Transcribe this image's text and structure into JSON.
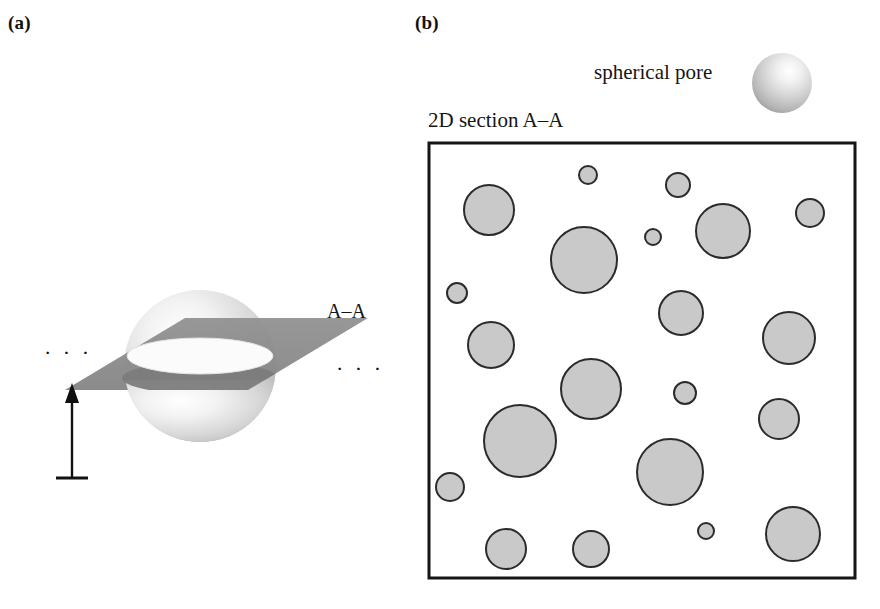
{
  "figure": {
    "background_color": "#ffffff",
    "width": 880,
    "height": 609
  },
  "panels": {
    "a": {
      "label": "(a)",
      "caption_aa": "A–A",
      "ellipsis_left": "· · ·",
      "ellipsis_right": "· · ·",
      "sphere": {
        "cx": 200,
        "cy": 366,
        "r": 76,
        "highlight_color": "#fdfdfd",
        "mid_color": "#d2d2d2",
        "edge_color": "#9a9a9a"
      },
      "cutting_plane": {
        "fill_color": "#8d8d8d",
        "band_fill_color": "#7e7e7e",
        "points": "65,390 185,318 368,318 248,390",
        "description": "horizontal sectioning plane A-A through sphere equator"
      },
      "depth_arrow": {
        "x": 72,
        "top_y": 386,
        "bottom_y": 478,
        "baseline_half_width": 16,
        "color": "#111111",
        "description": "vertical arrow indicating section depth"
      }
    },
    "b": {
      "label": "(b)",
      "legend_label": "spherical pore",
      "section_caption": "2D section A–A",
      "legend_sphere": {
        "cx": 782,
        "cy": 83,
        "r": 30,
        "highlight_color": "#fefefe",
        "mid_color": "#cfcfcf",
        "edge_color": "#8f8f8f"
      },
      "section_box": {
        "x": 429,
        "y": 143,
        "width": 426,
        "height": 435,
        "stroke_color": "#151515",
        "stroke_width": 3,
        "fill_color": "#ffffff"
      },
      "pore_style": {
        "fill_color": "#c9c9c9",
        "stroke_color": "#2b2b2b",
        "stroke_width": 2
      },
      "pores": [
        {
          "id": 1,
          "cx": 588,
          "cy": 175,
          "r": 9
        },
        {
          "id": 2,
          "cx": 678,
          "cy": 185,
          "r": 12
        },
        {
          "id": 3,
          "cx": 489,
          "cy": 210,
          "r": 25
        },
        {
          "id": 4,
          "cx": 810,
          "cy": 213,
          "r": 14
        },
        {
          "id": 5,
          "cx": 723,
          "cy": 231,
          "r": 27
        },
        {
          "id": 6,
          "cx": 584,
          "cy": 260,
          "r": 33
        },
        {
          "id": 7,
          "cx": 653,
          "cy": 237,
          "r": 8
        },
        {
          "id": 8,
          "cx": 457,
          "cy": 293,
          "r": 10
        },
        {
          "id": 9,
          "cx": 491,
          "cy": 345,
          "r": 23
        },
        {
          "id": 10,
          "cx": 681,
          "cy": 313,
          "r": 22
        },
        {
          "id": 11,
          "cx": 789,
          "cy": 338,
          "r": 26
        },
        {
          "id": 12,
          "cx": 591,
          "cy": 389,
          "r": 30
        },
        {
          "id": 13,
          "cx": 685,
          "cy": 393,
          "r": 11
        },
        {
          "id": 14,
          "cx": 520,
          "cy": 441,
          "r": 36
        },
        {
          "id": 15,
          "cx": 779,
          "cy": 419,
          "r": 20
        },
        {
          "id": 16,
          "cx": 450,
          "cy": 487,
          "r": 14
        },
        {
          "id": 17,
          "cx": 670,
          "cy": 472,
          "r": 33
        },
        {
          "id": 18,
          "cx": 506,
          "cy": 549,
          "r": 20
        },
        {
          "id": 19,
          "cx": 591,
          "cy": 549,
          "r": 18
        },
        {
          "id": 20,
          "cx": 706,
          "cy": 531,
          "r": 8
        },
        {
          "id": 21,
          "cx": 793,
          "cy": 534,
          "r": 27
        }
      ]
    }
  }
}
